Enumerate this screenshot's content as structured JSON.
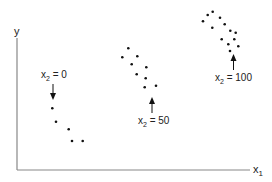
{
  "chart_data": {
    "type": "scatter",
    "title": "",
    "xlabel": "x1",
    "ylabel": "y",
    "grid": false,
    "legend": "none",
    "axes_ticks": "none",
    "series": [
      {
        "name": "x2 = 0",
        "annotation": "x2 = 0",
        "points_px": [
          [
            52.3,
            108.3
          ],
          [
            56,
            121.7
          ],
          [
            68.7,
            129.3
          ],
          [
            72,
            141
          ],
          [
            82.7,
            141
          ]
        ]
      },
      {
        "name": "x2 = 50",
        "annotation": "x2 = 50",
        "points_px": [
          [
            128.3,
            48.3
          ],
          [
            122.3,
            57.3
          ],
          [
            137.3,
            56.3
          ],
          [
            131.7,
            64.3
          ],
          [
            146.3,
            67.3
          ],
          [
            136.7,
            74.3
          ],
          [
            145.7,
            78.3
          ],
          [
            144.7,
            87.3
          ],
          [
            156,
            85.7
          ]
        ]
      },
      {
        "name": "x2 = 100",
        "annotation": "x2 = 100",
        "points_px": [
          [
            207.7,
            15
          ],
          [
            212.7,
            11.7
          ],
          [
            203,
            21.3
          ],
          [
            220,
            17.7
          ],
          [
            224.7,
            24.3
          ],
          [
            212.3,
            27.7
          ],
          [
            230.3,
            30.7
          ],
          [
            235.7,
            32.7
          ],
          [
            221.7,
            39.3
          ],
          [
            234.3,
            39.3
          ],
          [
            228.3,
            44.3
          ],
          [
            238.3,
            46.3
          ],
          [
            230,
            51
          ]
        ]
      }
    ]
  },
  "labels": {
    "y_axis": "y",
    "x_axis_main": "x",
    "x_axis_sub": "1",
    "ann0_main": "x",
    "ann0_sub": "2",
    "ann0_val": " = 0",
    "ann50_main": "x",
    "ann50_sub": "2",
    "ann50_val": " = 50",
    "ann100_main": "x",
    "ann100_sub": "2",
    "ann100_val": " = 100"
  },
  "colors": {
    "axis": "#888888",
    "dot": "#111111",
    "text": "#222222"
  }
}
